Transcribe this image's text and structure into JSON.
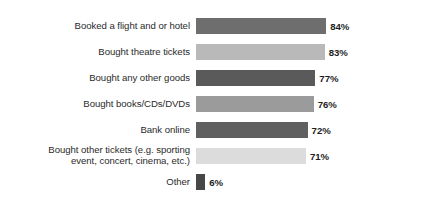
{
  "chart_data": {
    "type": "bar",
    "orientation": "horizontal",
    "title": "",
    "xlabel": "",
    "ylabel": "",
    "grid": false,
    "legend": "none",
    "xlim": [
      0,
      100
    ],
    "value_suffix": "%",
    "categories": [
      "Booked a flight and or hotel",
      "Bought theatre tickets",
      "Bought any other goods",
      "Bought books/CDs/DVDs",
      "Bank online",
      "Bought other tickets (e.g. sporting\nevent, concert, cinema, etc.)",
      "Other"
    ],
    "values": [
      84,
      83,
      77,
      76,
      72,
      71,
      6
    ],
    "value_labels": [
      "84%",
      "83%",
      "77%",
      "76%",
      "72%",
      "71%",
      "6%"
    ],
    "bar_colors": [
      "#6e6e6e",
      "#b9b9b9",
      "#5a5a5a",
      "#9b9b9b",
      "#606060",
      "#dcdcdc",
      "#474747"
    ]
  },
  "colors": {
    "background": "#ffffff",
    "label_text": "#2b2b2b",
    "value_text": "#1d1d1d"
  }
}
